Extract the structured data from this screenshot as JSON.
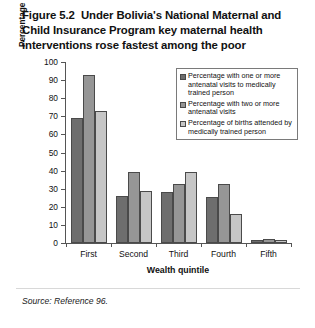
{
  "figure": {
    "title_lines": [
      "Figure 5.2  Under Bolivia's National Maternal and",
      "Child Insurance Program key maternal health",
      "interventions rose fastest among the poor"
    ],
    "source": "Source: Reference 96."
  },
  "chart_data": {
    "type": "bar",
    "title": "Figure 5.2  Under Bolivia's National Maternal and Child Insurance Program key maternal health interventions rose fastest among the poor",
    "xlabel": "Wealth quintile",
    "ylabel": "Percentage increase 1994–98",
    "categories": [
      "First",
      "Second",
      "Third",
      "Fourth",
      "Fifth"
    ],
    "ylim": [
      0,
      100
    ],
    "yticks": [
      0,
      10,
      20,
      30,
      40,
      50,
      60,
      70,
      80,
      90,
      100
    ],
    "ytick_labels": [
      "0",
      "10",
      "20",
      "30",
      "40",
      "50",
      "60",
      "70",
      "80",
      "90",
      "100"
    ],
    "grid": false,
    "legend_position": "upper right",
    "series": [
      {
        "name": "Percentage with one or more antenatal visits to medically trained person",
        "color": "#6e6e6e",
        "values": [
          69,
          25.8,
          28,
          25.5,
          1.8
        ]
      },
      {
        "name": "Percentage with two or more antenatal visits",
        "color": "#969696",
        "values": [
          93,
          39.2,
          32.4,
          32.4,
          2.4
        ]
      },
      {
        "name": "Percentage of births attended by medically trained person",
        "color": "#c6c6c6",
        "values": [
          73,
          28.8,
          39.5,
          16,
          1.6
        ]
      }
    ]
  }
}
